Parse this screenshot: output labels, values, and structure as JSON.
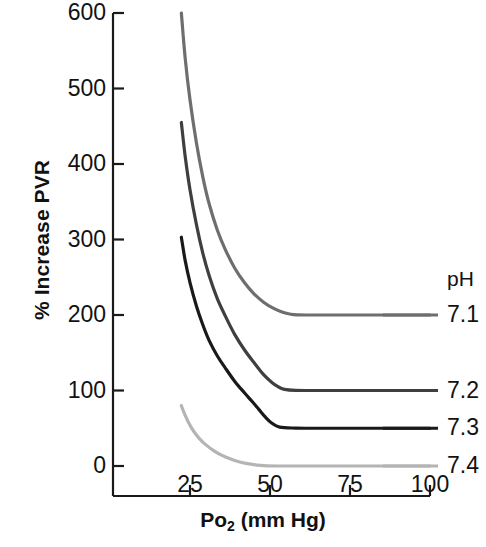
{
  "chart_data": {
    "type": "line",
    "title": "",
    "xlabel": "Po2 (mm Hg)",
    "xlabel_base": "Po",
    "xlabel_sub": "2",
    "xlabel_unit": " (mm Hg)",
    "ylabel": "% Increase PVR",
    "xlim": [
      17,
      100
    ],
    "ylim": [
      -40,
      600
    ],
    "xticks": [
      25,
      50,
      75,
      100
    ],
    "yticks": [
      0,
      100,
      200,
      300,
      400,
      500,
      600
    ],
    "xtick_labels": [
      "25",
      "50",
      "75",
      "100"
    ],
    "ytick_labels": [
      "0",
      "100",
      "200",
      "300",
      "400",
      "500",
      "600"
    ],
    "grid": false,
    "legend_position": "right",
    "legend_title": "pH",
    "series": [
      {
        "name": "7.1",
        "color": "#6e6e6e",
        "plateau": 200,
        "x": [
          22.3,
          23.5,
          25,
          27,
          29,
          31,
          33.5,
          36,
          39,
          42,
          45,
          48,
          51,
          54,
          56.5,
          58.5,
          62,
          70,
          80,
          90,
          100
        ],
        "values": [
          600,
          540,
          485,
          428,
          383,
          347,
          313,
          287,
          262,
          243,
          228,
          217,
          209,
          203.5,
          201,
          200.2,
          200,
          200,
          200,
          200,
          200
        ]
      },
      {
        "name": "7.2",
        "color": "#3f3f3f",
        "plateau": 100,
        "x": [
          22.3,
          23.5,
          25,
          27,
          29,
          31,
          33.5,
          36,
          39,
          42,
          45,
          48,
          50.5,
          52.5,
          54.5,
          58,
          65,
          75,
          85,
          100
        ],
        "values": [
          455,
          410,
          366,
          320,
          282,
          252,
          222,
          199,
          174,
          154,
          137,
          121,
          111,
          105,
          101.5,
          100.2,
          100,
          100,
          100,
          100
        ]
      },
      {
        "name": "7.3",
        "color": "#191919",
        "plateau": 50,
        "x": [
          22.3,
          23.5,
          25,
          27,
          29,
          31,
          33.5,
          36,
          39,
          42,
          44.5,
          46.5,
          48.5,
          50.5,
          53,
          58,
          65,
          75,
          85,
          100
        ],
        "values": [
          303,
          272,
          243,
          212,
          187,
          166,
          146,
          130,
          112,
          97,
          85,
          75,
          65,
          57,
          51.5,
          50.2,
          50,
          50,
          50,
          50
        ]
      },
      {
        "name": "7.4",
        "color": "#b4b4b4",
        "plateau": 0,
        "x": [
          22.3,
          23.2,
          24.5,
          26,
          28,
          30,
          32.5,
          35,
          37.5,
          40,
          42.5,
          45,
          47,
          49,
          52,
          58,
          65,
          75,
          85,
          100
        ],
        "values": [
          80,
          70,
          58,
          47,
          36,
          28,
          20,
          14,
          9.5,
          6,
          3.5,
          1.8,
          0.8,
          0.2,
          0,
          0,
          0,
          0,
          0,
          0
        ]
      }
    ]
  },
  "axes": {
    "axis_color": "#1a1a1a"
  }
}
